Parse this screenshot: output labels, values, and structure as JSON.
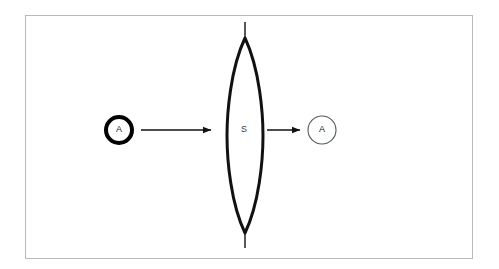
{
  "figure": {
    "kind": "optical-lens-ray-diagram",
    "background_color": "#ffffff",
    "frame": {
      "border_color": "#b9b9b9",
      "fill_color": "#ffffff",
      "x": 25,
      "y": 15,
      "width": 448,
      "height": 244
    }
  },
  "elements": {
    "object_circle": {
      "label": "A",
      "x": 119,
      "y": 130,
      "radius": 15,
      "stroke_width": 4,
      "stroke_color": "#000000",
      "fill_color": "#ffffff",
      "role": "object"
    },
    "lens": {
      "label": "S",
      "label_x": 245,
      "label_y": 130,
      "center_x": 245,
      "top_apex_y": 38,
      "bottom_apex_y": 233,
      "half_width": 18,
      "stroke_width": 3,
      "stroke_color": "#111111",
      "fill_color": "#ffffff",
      "shape": "biconvex-lens"
    },
    "optical_axis_top": {
      "x": 245,
      "y_start": 22,
      "y_end": 40,
      "stroke_width": 1.4,
      "stroke_color": "#111111"
    },
    "optical_axis_bottom": {
      "x": 245,
      "y_start": 231,
      "y_end": 248,
      "stroke_width": 1.4,
      "stroke_color": "#111111"
    },
    "incoming_arrow": {
      "x_start": 141,
      "x_end": 214,
      "y": 130,
      "stroke_width": 1.3,
      "stroke_color": "#111111",
      "direction": "right"
    },
    "outgoing_arrow": {
      "x_start": 267,
      "x_end": 303,
      "y": 130,
      "stroke_width": 1.3,
      "stroke_color": "#111111",
      "direction": "right"
    },
    "image_circle": {
      "label": "A",
      "x": 322,
      "y": 130,
      "radius": 14,
      "stroke_width": 1.1,
      "stroke_color": "#555555",
      "fill_color": "#ffffff",
      "role": "image"
    }
  },
  "colors": {
    "ink": "#000000",
    "ink_soft": "#555555",
    "frame_border": "#b9b9b9",
    "paper": "#ffffff"
  }
}
